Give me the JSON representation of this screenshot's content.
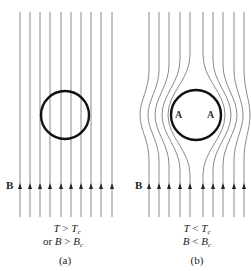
{
  "figure": {
    "panels": [
      {
        "id": "a",
        "caption": "(a)",
        "condition_line1": {
          "T": "T",
          "op": ">",
          "Tc": "T",
          "sub": "c"
        },
        "condition_line2": {
          "prefix": "or",
          "B": "B",
          "op": ">",
          "Bc": "B",
          "sub": "c"
        },
        "field_label": "B",
        "description": "Uniform magnetic field lines pass straight through the sample (normal state)"
      },
      {
        "id": "b",
        "caption": "(b)",
        "condition_line1": {
          "T": "T",
          "op": "<",
          "Tc": "T",
          "sub": "c"
        },
        "condition_line2": {
          "B": "B",
          "op": "<",
          "Bc": "B",
          "sub": "c"
        },
        "field_label": "B",
        "point_labels": [
          "A",
          "A"
        ],
        "description": "Field lines expelled from the superconducting sample (Meissner effect)"
      }
    ],
    "colors": {
      "lines": "#8a8a8a",
      "circle": "#111111",
      "text": "#222222"
    }
  }
}
